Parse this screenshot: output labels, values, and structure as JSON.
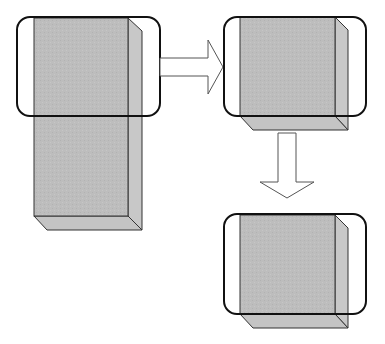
{
  "diagram": {
    "colors": {
      "box_fill": "#bdbdbd",
      "box_side": "#c8c8c8",
      "box_bottom": "#c4c4c4",
      "box_stroke": "#333333",
      "frame_stroke": "#111111",
      "arrow_fill": "#ffffff",
      "arrow_stroke": "#555555"
    },
    "shapes": [
      {
        "id": "tall-box",
        "label": ""
      },
      {
        "id": "crop-frame-left",
        "label": ""
      },
      {
        "id": "arrow-right",
        "label": ""
      },
      {
        "id": "short-box-top",
        "label": ""
      },
      {
        "id": "crop-frame-top-right",
        "label": ""
      },
      {
        "id": "arrow-down",
        "label": ""
      },
      {
        "id": "short-box-bottom",
        "label": ""
      },
      {
        "id": "crop-frame-bottom-right",
        "label": ""
      }
    ]
  }
}
